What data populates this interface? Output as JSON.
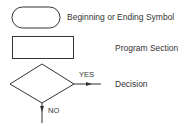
{
  "legend": [
    {
      "symbol": "rounded-rectangle",
      "label": "Beginning or Ending Symbol"
    },
    {
      "symbol": "rectangle",
      "label": "Program Section"
    },
    {
      "symbol": "diamond",
      "label": "Decision"
    }
  ],
  "decision_branches": {
    "yes": "YES",
    "no": "NO"
  },
  "colors": {
    "stroke": "#333333",
    "background": "#ffffff"
  }
}
